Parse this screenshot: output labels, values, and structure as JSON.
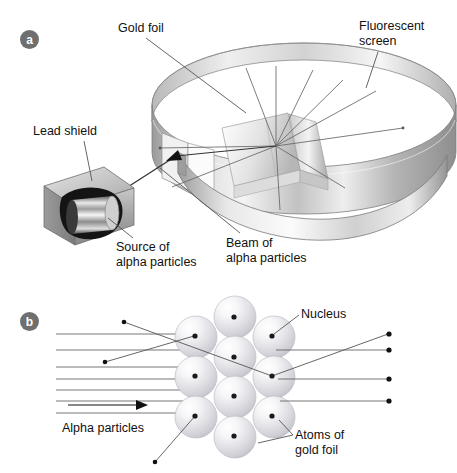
{
  "figure": {
    "background": "#ffffff",
    "width": 457,
    "height": 473
  },
  "panels": [
    {
      "id": "a",
      "badge_label": "a",
      "badge_color": "#6f6f6f",
      "badge_text_color": "#ffffff",
      "caption": "Experimental apparatus"
    },
    {
      "id": "b",
      "badge_label": "b",
      "badge_color": "#6f6f6f",
      "badge_text_color": "#ffffff",
      "caption": "Scattering at the atomic scale"
    }
  ],
  "panel_a": {
    "labels": {
      "gold_foil": "Gold foil",
      "fluorescent_screen": "Fluorescent\nscreen",
      "lead_shield": "Lead shield",
      "source": "Source of\nalpha particles",
      "beam": "Beam of\nalpha particles"
    },
    "colors": {
      "line": "#555555",
      "text": "#111111",
      "metal_light": "#f2f2f2",
      "metal_mid": "#c9c9c9",
      "metal_dark": "#8a8a8a",
      "shield_face": "#b5b5b5",
      "shield_top": "#d6d6d6",
      "shield_side": "#8f8f8f",
      "source_dark": "#121212"
    }
  },
  "panel_b": {
    "labels": {
      "nucleus": "Nucleus",
      "alpha_particles": "Alpha particles",
      "atoms_of_gold_foil": "Atoms of\ngold foil"
    },
    "colors": {
      "line": "#555555",
      "text": "#111111",
      "atom_light": "#fbfbfb",
      "atom_mid": "#d3d3d8",
      "atom_edge": "#a9a9b0",
      "nucleus": "#1a1a1a"
    },
    "atom_radius": 21,
    "atoms": [
      {
        "cx": 196,
        "cy": 337
      },
      {
        "cx": 235,
        "cy": 317
      },
      {
        "cx": 274,
        "cy": 337
      },
      {
        "cx": 196,
        "cy": 377
      },
      {
        "cx": 235,
        "cy": 357
      },
      {
        "cx": 274,
        "cy": 377
      },
      {
        "cx": 196,
        "cy": 417
      },
      {
        "cx": 235,
        "cy": 397
      },
      {
        "cx": 274,
        "cy": 417
      },
      {
        "cx": 235,
        "cy": 437
      }
    ],
    "nuclei": [
      {
        "cx": 195,
        "cy": 336
      },
      {
        "cx": 234,
        "cy": 317
      },
      {
        "cx": 272,
        "cy": 336
      },
      {
        "cx": 195,
        "cy": 376
      },
      {
        "cx": 234,
        "cy": 357
      },
      {
        "cx": 272,
        "cy": 376
      },
      {
        "cx": 195,
        "cy": 416
      },
      {
        "cx": 234,
        "cy": 396
      },
      {
        "cx": 272,
        "cy": 416
      },
      {
        "cx": 234,
        "cy": 436
      }
    ],
    "incoming_ray_y": [
      334,
      350,
      367,
      379,
      390,
      401,
      413
    ],
    "arrow": {
      "x1": 68,
      "y1": 405,
      "x2": 146,
      "y2": 405
    },
    "straight_exit_rays": [
      {
        "x1": 278,
        "y1": 350,
        "x2": 392,
        "y2": 350
      },
      {
        "x1": 280,
        "y1": 379,
        "x2": 392,
        "y2": 379
      },
      {
        "x1": 282,
        "y1": 401,
        "x2": 392,
        "y2": 401
      }
    ],
    "deflected_tracks": [
      {
        "from_x": 120,
        "from_y": 322,
        "to_x": 273,
        "to_y": 376
      },
      {
        "from_x": 102,
        "from_y": 361,
        "to_x": 194,
        "to_y": 336
      },
      {
        "from_x": 272,
        "from_y": 376,
        "to_x": 391,
        "to_y": 334
      },
      {
        "from_x": 195,
        "from_y": 416,
        "to_x": 152,
        "to_y": 463
      }
    ]
  }
}
